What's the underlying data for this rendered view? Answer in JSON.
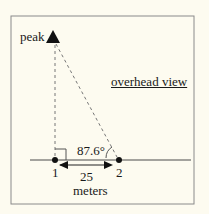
{
  "diagram": {
    "peak_label": "peak",
    "view_label": "overhead view",
    "angle_label": "87.6°",
    "point1_label": "1",
    "point2_label": "2",
    "distance_label": "25",
    "unit_label": "meters"
  }
}
